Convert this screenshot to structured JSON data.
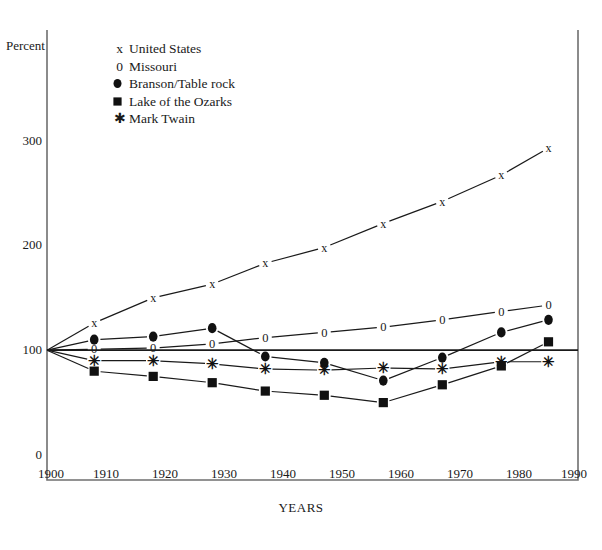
{
  "chart_data": {
    "type": "line",
    "title": "",
    "xlabel": "YEARS",
    "ylabel": "Percent",
    "xlim": [
      1900,
      1990
    ],
    "ylim": [
      0,
      320
    ],
    "xticks": [
      "1900",
      "1910",
      "1920",
      "1930",
      "1940",
      "1950",
      "1960",
      "1970",
      "1980",
      "1990"
    ],
    "yticks": [
      "0",
      "100",
      "200",
      "300"
    ],
    "grid": false,
    "reference_line": 100,
    "legend_position": "top-left-inside",
    "note": "All series indexed to 100 at 1900",
    "series": [
      {
        "name": "United States",
        "marker": "x",
        "legend_label": "x = United States",
        "x": [
          1900,
          1908,
          1918,
          1928,
          1937,
          1947,
          1957,
          1967,
          1977,
          1985
        ],
        "values": [
          100,
          126,
          150,
          163,
          183,
          198,
          221,
          242,
          267,
          293
        ]
      },
      {
        "name": "Missouri",
        "marker": "0",
        "legend_label": "0 = Missouri",
        "x": [
          1900,
          1908,
          1918,
          1928,
          1937,
          1947,
          1957,
          1967,
          1977,
          1985
        ],
        "values": [
          100,
          101,
          102,
          106,
          112,
          117,
          122,
          129,
          137,
          143
        ]
      },
      {
        "name": "Branson/Table rock",
        "marker": "filled-circle",
        "legend_label": "= Branson/Table rock",
        "x": [
          1900,
          1908,
          1918,
          1928,
          1937,
          1947,
          1957,
          1967,
          1977,
          1985
        ],
        "values": [
          100,
          110,
          113,
          121,
          94,
          88,
          71,
          93,
          117,
          129
        ]
      },
      {
        "name": "Lake of the Ozarks",
        "marker": "filled-square",
        "legend_label": "= Lake of the Ozarks",
        "x": [
          1900,
          1908,
          1918,
          1928,
          1937,
          1947,
          1957,
          1967,
          1977,
          1985
        ],
        "values": [
          100,
          80,
          75,
          69,
          61,
          57,
          50,
          67,
          85,
          108
        ]
      },
      {
        "name": "Mark Twain",
        "marker": "asterisk",
        "legend_label": "= Mark Twain",
        "x": [
          1900,
          1908,
          1918,
          1928,
          1937,
          1947,
          1957,
          1967,
          1977,
          1985
        ],
        "values": [
          100,
          90,
          90,
          87,
          82,
          81,
          83,
          82,
          89,
          89
        ]
      }
    ]
  },
  "axes": {
    "ylabel": "Percent",
    "xlabel": "YEARS"
  },
  "caption": {
    "text": ""
  }
}
